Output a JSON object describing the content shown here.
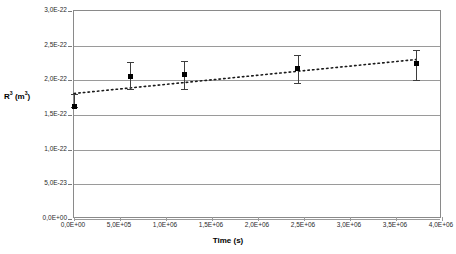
{
  "axes": {
    "x_title": "Time (s)",
    "y_title_html": "R<sup>3</sup> (m<sup>3</sup>)",
    "x_ticks": [
      "0,0E+00",
      "5,0E+05",
      "1,0E+06",
      "1,5E+06",
      "2,0E+06",
      "2,5E+06",
      "3,0E+06",
      "3,5E+06",
      "4,0E+06"
    ],
    "y_ticks": [
      "3,0E-22",
      "2,5E-22",
      "2,0E-22",
      "1,5E-22",
      "1,0E-22",
      "5,0E-23",
      "0,0E+00"
    ]
  },
  "colors": {
    "marker": "#000000",
    "error_bar": "#3d3d3d",
    "gridline": "#9a9a9a",
    "frame": "#8a8a8a",
    "trendline": "#1a1a1a",
    "background": "#ffffff"
  },
  "chart_data": {
    "type": "scatter",
    "title": "",
    "xlabel": "Time (s)",
    "ylabel": "R^3 (m^3)",
    "xlim": [
      0,
      4000000
    ],
    "ylim": [
      0,
      3e-22
    ],
    "grid": "horizontal",
    "legend": "none",
    "x_tick_values": [
      0,
      500000,
      1000000,
      1500000,
      2000000,
      2500000,
      3000000,
      3500000,
      4000000
    ],
    "y_tick_values": [
      3e-22,
      2.5e-22,
      2e-22,
      1.5e-22,
      1e-22,
      5e-23,
      0.0
    ],
    "series": [
      {
        "name": "R^3 measurements",
        "marker": "filled-square",
        "x": [
          0,
          610000,
          1200000,
          2430000,
          3720000
        ],
        "y": [
          1.62e-22,
          2.06e-22,
          2.08e-22,
          2.17e-22,
          2.25e-22
        ],
        "yerr_low": [
          1.62e-22,
          1.88e-22,
          1.87e-22,
          1.96e-22,
          2.01e-22
        ],
        "yerr_high": [
          1.8e-22,
          2.27e-22,
          2.28e-22,
          2.37e-22,
          2.44e-22
        ]
      },
      {
        "name": "trendline",
        "style": "dotted",
        "x": [
          0,
          3720000
        ],
        "y": [
          1.81e-22,
          2.3e-22
        ]
      }
    ]
  }
}
